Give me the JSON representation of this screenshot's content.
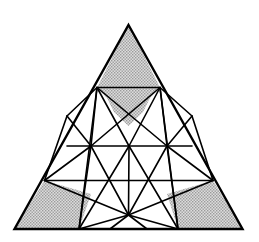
{
  "figure": {
    "type": "geometric-diagram",
    "canvas": {
      "width": 259,
      "height": 242
    },
    "colors": {
      "background": "#ffffff",
      "stroke": "#000000",
      "shade_fill": "#c8c8c8",
      "shade_pattern_dot": "#8a8a8a"
    },
    "style": {
      "outer_stroke_width": 2.2,
      "inner_stroke_width": 1.6,
      "shade_pattern": "fine-stipple-dots"
    },
    "outer_triangle": {
      "apex": [
        128.5,
        25.0
      ],
      "bottom_left": [
        14.5,
        229.0
      ],
      "bottom_right": [
        242.5,
        229.0
      ]
    },
    "points": {
      "A": [
        128.5,
        25.0
      ],
      "B": [
        14.5,
        229.0
      ],
      "C": [
        242.5,
        229.0
      ],
      "L1": [
        97.0,
        87.5
      ],
      "R1": [
        160.0,
        87.5
      ],
      "L2": [
        67.0,
        116.0
      ],
      "R2": [
        192.0,
        116.0
      ],
      "M1": [
        91.0,
        146.0
      ],
      "M2": [
        129.0,
        146.0
      ],
      "M3": [
        167.0,
        146.0
      ],
      "E1": [
        44.5,
        180.5
      ],
      "E2": [
        213.0,
        180.5
      ],
      "BL": [
        79.0,
        229.0
      ],
      "BR": [
        178.0,
        229.0
      ],
      "BM": [
        128.5,
        215.0
      ]
    },
    "segments": [
      {
        "name": "outer-left-edge",
        "from": "A",
        "to": "B"
      },
      {
        "name": "outer-right-edge",
        "from": "A",
        "to": "C"
      },
      {
        "name": "outer-base-edge",
        "from": "B",
        "to": "C"
      },
      {
        "name": "upper-crossbar",
        "from": "L1",
        "to": "R1"
      },
      {
        "name": "mid-horizontal",
        "from": "M1",
        "to": "M3"
      },
      {
        "name": "lower-horizontal",
        "from": "E1",
        "to": "E2"
      },
      {
        "name": "left-rail-L1-M1",
        "from": "L1",
        "to": "M1"
      },
      {
        "name": "left-rail-L2-M1",
        "from": "L2",
        "to": "M1"
      },
      {
        "name": "left-rail-L1-L2",
        "from": "L1",
        "to": "L2"
      },
      {
        "name": "right-rail-R1-M3",
        "from": "R1",
        "to": "M3"
      },
      {
        "name": "right-rail-R2-M3",
        "from": "R2",
        "to": "M3"
      },
      {
        "name": "right-rail-R1-R2",
        "from": "R1",
        "to": "R2"
      },
      {
        "name": "diag-L1-M2",
        "from": "L1",
        "to": "M2"
      },
      {
        "name": "diag-R1-M2",
        "from": "R1",
        "to": "M2"
      },
      {
        "name": "diag-L1-M3",
        "from": "L1",
        "to": "M3"
      },
      {
        "name": "diag-R1-M1",
        "from": "R1",
        "to": "M1"
      },
      {
        "name": "diag-L1-BL",
        "from": "L1",
        "to": "BL"
      },
      {
        "name": "diag-R1-BR",
        "from": "R1",
        "to": "BR"
      },
      {
        "name": "diag-M1-E1",
        "from": "M1",
        "to": "E1"
      },
      {
        "name": "diag-M3-E2",
        "from": "M3",
        "to": "E2"
      },
      {
        "name": "diag-M1-BL",
        "from": "M1",
        "to": "BL"
      },
      {
        "name": "diag-M3-BR",
        "from": "M3",
        "to": "BR"
      },
      {
        "name": "diag-M2-BL",
        "from": "M2",
        "to": "BL"
      },
      {
        "name": "diag-M2-BR",
        "from": "M2",
        "to": "BR"
      },
      {
        "name": "diag-M1-BM",
        "from": "M1",
        "to": "BM"
      },
      {
        "name": "diag-M3-BM",
        "from": "M3",
        "to": "BM"
      },
      {
        "name": "diag-M2-BM",
        "from": "M2",
        "to": "BM"
      },
      {
        "name": "base-BM-BL",
        "from": "BM",
        "to": "BL"
      },
      {
        "name": "base-BM-BR",
        "from": "BM",
        "to": "BR"
      },
      {
        "name": "spoke-BM-left-base",
        "from": "BM",
        "to": "BMLB"
      },
      {
        "name": "spoke-BM-right-base",
        "from": "BM",
        "to": "BMRB"
      },
      {
        "name": "diag-E1-BM",
        "from": "E1",
        "to": "BM"
      },
      {
        "name": "diag-E2-BM",
        "from": "E2",
        "to": "BM"
      },
      {
        "name": "vert-L1-BL",
        "from": "L1",
        "to": "BL"
      },
      {
        "name": "vert-R1-BR",
        "from": "R1",
        "to": "BR"
      }
    ],
    "extra_points": {
      "BMLB": [
        106.0,
        229.0
      ],
      "BMRB": [
        151.0,
        229.0
      ]
    },
    "shaded_regions": [
      {
        "name": "top-shaded-triangle",
        "vertices": [
          [
            128.5,
            25.0
          ],
          [
            97.0,
            87.5
          ],
          [
            160.0,
            87.5
          ]
        ],
        "note": "apex region above upper crossbar, dipping at center"
      },
      {
        "name": "bottom-left-shaded-quad",
        "vertices": [
          [
            14.5,
            229.0
          ],
          [
            44.5,
            180.5
          ],
          [
            79.0,
            229.0
          ]
        ],
        "note": "left base corner region bounded by lower horizontal"
      },
      {
        "name": "bottom-right-shaded-quad",
        "vertices": [
          [
            242.5,
            229.0
          ],
          [
            213.0,
            180.5
          ],
          [
            178.0,
            229.0
          ]
        ],
        "note": "right base corner region bounded by lower horizontal"
      }
    ]
  }
}
